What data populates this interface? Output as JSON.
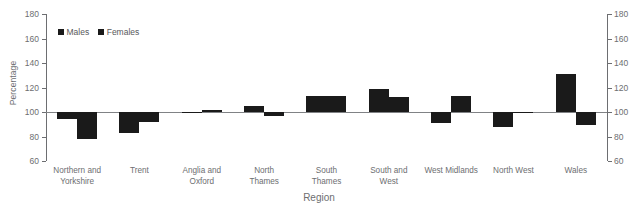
{
  "chart_data": {
    "type": "bar",
    "title": "",
    "xlabel": "Region",
    "ylabel": "Percentage",
    "ylim": [
      60,
      180
    ],
    "yticks": [
      60,
      80,
      100,
      120,
      140,
      160,
      180
    ],
    "ytick_labels": [
      "60",
      "80",
      "100",
      "120",
      "140",
      "160",
      "180"
    ],
    "baseline": 100,
    "grid": false,
    "legend_position": "top-left",
    "dual_axis": true,
    "categories": [
      "Northern and Yorkshire",
      "Trent",
      "Anglia and Oxford",
      "North Thames",
      "South Thames",
      "South and West",
      "West Midlands",
      "North West",
      "Wales"
    ],
    "category_lines": [
      [
        "Northern and",
        "Yorkshire"
      ],
      [
        "Trent"
      ],
      [
        "Anglia and",
        "Oxford"
      ],
      [
        "North",
        "Thames"
      ],
      [
        "South",
        "Thames"
      ],
      [
        "South and",
        "West"
      ],
      [
        "West Midlands"
      ],
      [
        "North West"
      ],
      [
        "Wales"
      ]
    ],
    "series": [
      {
        "name": "Males",
        "color": "#1a1a1a",
        "values": [
          94,
          83,
          99,
          105,
          113,
          119,
          91,
          88,
          131
        ]
      },
      {
        "name": "Females",
        "color": "#1a1a1a",
        "values": [
          78,
          92,
          102,
          97,
          113,
          112,
          113,
          100,
          89
        ]
      }
    ]
  },
  "legend": {
    "items": [
      {
        "label": "Males"
      },
      {
        "label": "Females"
      }
    ]
  },
  "colors": {
    "bar": "#1a1a1a",
    "axis": "#6d6e71",
    "text": "#6d6e71",
    "background": "#ffffff"
  }
}
